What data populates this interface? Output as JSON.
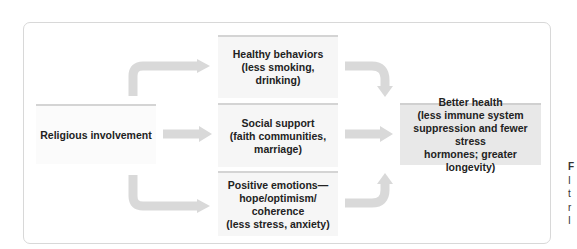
{
  "diagram": {
    "source": {
      "label": "Religious involvement"
    },
    "mediators": [
      {
        "title": "Healthy behaviors",
        "lines": [
          "Healthy behaviors",
          "(less smoking, drinking)"
        ]
      },
      {
        "title": "Social support",
        "lines": [
          "Social support",
          "(faith communities,",
          "marriage)"
        ]
      },
      {
        "title": "Positive emotions",
        "lines": [
          "Positive emotions—",
          "hope/optimism/",
          "coherence",
          "(less stress, anxiety)"
        ]
      }
    ],
    "outcome": {
      "lines": [
        "Better health",
        "(less immune system",
        "suppression and fewer stress",
        "hormones; greater longevity)"
      ]
    },
    "colors": {
      "arrow": "#d9d9d9",
      "box": "#f6f6f6",
      "outcome_box": "#e8e8e8",
      "frame_border": "#d8d8d8"
    },
    "caption_fragments": [
      "F",
      "I",
      "t",
      "r",
      "I"
    ]
  }
}
